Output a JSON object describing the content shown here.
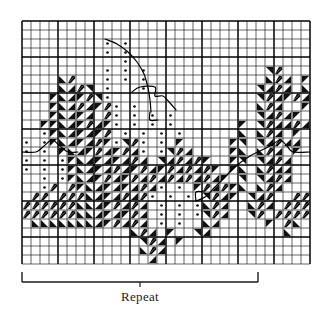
{
  "figure": {
    "kind": "knitting-colorwork-chart",
    "title_visible": false
  },
  "grid": {
    "columns": 32,
    "rows": 27,
    "cell_size_px": 9,
    "origin_x_px": 22,
    "origin_y_px": 21,
    "line_color": "#222222",
    "heavy_line_color": "#000000",
    "heavy_every_cols": 4,
    "heavy_every_rows": 4,
    "background": "#ffffff"
  },
  "legend_symbols": [
    {
      "code": ".",
      "name": "dot",
      "description": "small centered dot"
    },
    {
      "code": "/",
      "name": "diagonal-stripe",
      "description": "diagonal hatch bar from lower-left to upper-right"
    },
    {
      "code": "1",
      "name": "triangle-upper-left",
      "description": "solid triangle filling upper-left half"
    },
    {
      "code": "2",
      "name": "triangle-upper-right",
      "description": "solid triangle filling upper-right half"
    },
    {
      "code": "3",
      "name": "triangle-lower-left",
      "description": "solid triangle filling lower-left half"
    },
    {
      "code": "4",
      "name": "triangle-lower-right",
      "description": "solid triangle filling lower-right half"
    },
    {
      "code": "#",
      "name": "solid-fill",
      "description": "fully filled black cell"
    },
    {
      "code": " ",
      "name": "blank",
      "description": "empty cell"
    }
  ],
  "chart_data": {
    "type": "heatmap",
    "title": "",
    "xlabel": "",
    "ylabel": "",
    "columns": 32,
    "rows": 27,
    "legend_position": "none",
    "grid": true,
    "cells": [
      "                                ",
      "                                ",
      "         . .                    ",
      "         . .                    ",
      "           .                    ",
      "         . . .             2/   ",
      "    3/   . . .             3/4 1",
      "    34/2 .   .            24/4 3",
      "   1341/2.                2/41/4",
      "   134/41/. .             3/4  1",
      "   13414 /. . . .         24/41 ",
      "  11341/41. . . .       1 2/44/4",
      "  .134141/ . . . .      3 3/4 1 ",
      ". .13414/1.2/. . 1     12 24/44 ",
      ". . 1341/41/4. .2/4    13 3/4 1 ",
      ". . .1341414/4 24/4/1  12 24/4  ",
      ". . .13414/41/41/4/4/1 13 3/44  ",
      "  . .1341/41/4/4/4/4/41 2 24/4  ",
      "  ./ /1341414/4. . 1/4/13 3/4   ",
      " // ///3414/4/. . . 2/41 24/  //",
      "//////3341/4/4 . . .3/4  3/4 ///",
      "//////334141/4 . . .2/4  2/ ////",
      " 333333341/4/4 . .  34     1 /3 ",
      "            3/4 1  24        3  ",
      "             2/4 1              ",
      "             3/4                ",
      "              4                 "
    ],
    "curves": [
      {
        "name": "upper-left-curve",
        "points": [
          [
            105,
            39
          ],
          [
            117,
            44
          ],
          [
            128,
            52
          ],
          [
            137,
            62
          ],
          [
            144,
            74
          ],
          [
            148,
            88
          ],
          [
            150,
            100
          ],
          [
            151,
            112
          ]
        ]
      },
      {
        "name": "upper-left-notch",
        "points": [
          [
            132,
            92
          ],
          [
            140,
            87
          ],
          [
            155,
            87
          ],
          [
            155,
            96
          ],
          [
            163,
            96
          ],
          [
            170,
            103
          ],
          [
            176,
            110
          ]
        ]
      },
      {
        "name": "left-horizon",
        "points": [
          [
            22,
            152
          ],
          [
            36,
            152
          ],
          [
            44,
            146
          ],
          [
            52,
            140
          ],
          [
            60,
            146
          ],
          [
            68,
            152
          ],
          [
            78,
            152
          ]
        ]
      },
      {
        "name": "right-rise",
        "points": [
          [
            196,
            201
          ],
          [
            205,
            197
          ],
          [
            214,
            188
          ],
          [
            224,
            178
          ],
          [
            236,
            166
          ],
          [
            250,
            156
          ],
          [
            262,
            150
          ],
          [
            272,
            145
          ],
          [
            280,
            140
          ],
          [
            287,
            146
          ],
          [
            293,
            152
          ],
          [
            310,
            152
          ]
        ]
      },
      {
        "name": "right-step",
        "points": [
          [
            196,
            201
          ],
          [
            196,
            192
          ],
          [
            205,
            192
          ]
        ]
      },
      {
        "name": "left-lower-step",
        "points": [
          [
            150,
            112
          ],
          [
            150,
            120
          ],
          [
            158,
            120
          ]
        ]
      }
    ]
  },
  "repeat_marker": {
    "label": "Repeat",
    "bracket_left_x_px": 22,
    "bracket_right_x_px": 258,
    "bracket_y_px": 272,
    "bracket_height_px": 10,
    "center_tick_x_px": 140,
    "color": "#1a1a1a"
  }
}
